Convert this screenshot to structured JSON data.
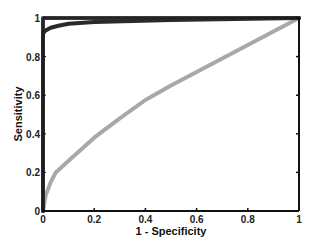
{
  "chart_data": {
    "type": "line",
    "title": "",
    "xlabel": "1 - Specificity",
    "ylabel": "Sensitivity",
    "xlim": [
      0,
      1
    ],
    "ylim": [
      0,
      1
    ],
    "grid": false,
    "legend": null,
    "xticks": [
      "0",
      "0.2",
      "0.4",
      "0.6",
      "0.8",
      "1"
    ],
    "yticks": [
      "0",
      "0.2",
      "0.4",
      "0.6",
      "0.8",
      "1"
    ],
    "series": [
      {
        "name": "perfect classifier",
        "color": "#3a3a3a",
        "width": 4,
        "x": [
          0,
          0,
          1
        ],
        "y": [
          0,
          1,
          1
        ]
      },
      {
        "name": "near-perfect ROC",
        "color": "#2a2a2a",
        "width": 4,
        "x": [
          0,
          0,
          0.01,
          0.03,
          0.06,
          0.1,
          0.2,
          0.35,
          0.5,
          0.75,
          1
        ],
        "y": [
          0,
          0.92,
          0.935,
          0.95,
          0.96,
          0.97,
          0.98,
          0.985,
          0.99,
          0.995,
          1
        ]
      },
      {
        "name": "moderate ROC",
        "color": "#a8a8a8",
        "width": 4,
        "x": [
          0,
          0.01,
          0.03,
          0.05,
          0.1,
          0.2,
          0.3,
          0.4,
          0.5,
          0.6,
          0.7,
          0.8,
          0.9,
          1
        ],
        "y": [
          0,
          0.08,
          0.15,
          0.2,
          0.26,
          0.38,
          0.48,
          0.575,
          0.65,
          0.72,
          0.79,
          0.86,
          0.93,
          1
        ]
      }
    ]
  }
}
